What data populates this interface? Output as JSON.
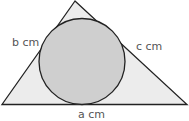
{
  "diagram": {
    "type": "inscribed-circle-triangle",
    "labels": {
      "left_side": "b cm",
      "right_side": "c cm",
      "bottom_side": "a cm"
    },
    "colors": {
      "triangle_fill": "#ececec",
      "circle_fill": "#cfcfcf",
      "stroke": "#222222",
      "label": "#555555"
    }
  }
}
